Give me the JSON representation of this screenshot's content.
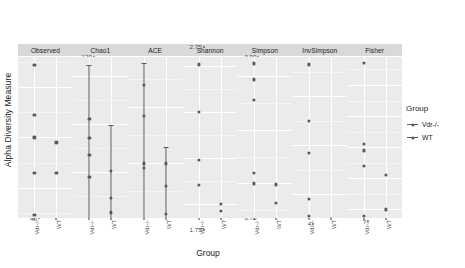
{
  "axes": {
    "y_title": "Alpha Diversity Measure",
    "x_title": "Group"
  },
  "legend": {
    "title": "Group",
    "items": [
      {
        "label": "Vdr-/-",
        "color": "#595959"
      },
      {
        "label": "WT",
        "color": "#595959"
      }
    ]
  },
  "groups": [
    "Vdr-/-",
    "WT"
  ],
  "chart_data": {
    "type": "scatter",
    "title": "",
    "xlabel": "Group",
    "ylabel": "Alpha Diversity Measure",
    "legend_position": "right",
    "grid": true,
    "facet_variable": "Alpha diversity index",
    "categories": [
      "Vdr-/-",
      "WT"
    ],
    "panels": [
      {
        "name": "Observed",
        "ylim": [
          37,
          76
        ],
        "ticks": [
          40,
          50,
          60,
          70
        ],
        "minor_ticks": [
          45,
          55,
          65,
          75
        ],
        "series": [
          {
            "name": "Vdr-/-",
            "values": [
              74.5,
              64.5,
              60.0,
              53.0,
              44.5
            ]
          },
          {
            "name": "WT",
            "values": [
              59.0,
              53.0,
              40.0
            ]
          }
        ],
        "errorbars": []
      },
      {
        "name": "Chao1",
        "ylim": [
          46,
          128
        ],
        "ticks": [
          60,
          80,
          100,
          120
        ],
        "minor_ticks": [
          50,
          70,
          90,
          110
        ],
        "series": [
          {
            "name": "Vdr-/-",
            "values": [
              102.0,
              94.0,
              87.0,
              78.0,
              57.5
            ]
          },
          {
            "name": "WT",
            "values": [
              80.5,
              69.0,
              63.0
            ]
          }
        ],
        "errorbars": [
          {
            "group": "Vdr-/-",
            "values": [
              102.0,
              94.0,
              87.0,
              78.0,
              57.5
            ],
            "lower": 48.0,
            "upper": 124.5
          },
          {
            "group": "WT",
            "values": [
              80.5,
              69.0,
              63.0
            ],
            "lower": 47.5,
            "upper": 99.5
          }
        ]
      },
      {
        "name": "ACE",
        "ylim": [
          48,
          118
        ],
        "ticks": [
          60,
          80,
          100
        ],
        "minor_ticks": [
          50,
          70,
          90,
          110
        ],
        "series": [
          {
            "name": "Vdr-/-",
            "values": [
              108.0,
              97.0,
              80.0,
              78.5,
              58.0
            ]
          },
          {
            "name": "WT",
            "values": [
              80.0,
              72.0,
              62.0
            ]
          }
        ],
        "errorbars": [
          {
            "group": "Vdr-/-",
            "values": [
              108.0,
              97.0,
              80.0,
              78.5,
              58.0
            ],
            "lower": 50.0,
            "upper": 116.0
          },
          {
            "group": "WT",
            "values": [
              80.0,
              72.0,
              62.0
            ],
            "lower": 53.0,
            "upper": 86.0
          }
        ]
      },
      {
        "name": "Shannon",
        "ylim": [
          1.73,
          2.8
        ],
        "ticks": [
          1.75,
          2.0,
          2.25,
          2.5,
          2.75
        ],
        "minor_ticks": [
          1.875,
          2.125,
          2.375,
          2.625
        ],
        "series": [
          {
            "name": "Vdr-/-",
            "values": [
              2.76,
              2.5,
              2.24,
              2.1
            ]
          },
          {
            "name": "WT",
            "values": [
              2.0,
              1.96,
              1.79
            ]
          }
        ],
        "errorbars": []
      },
      {
        "name": "Simpson",
        "ylim": [
          0.735,
          0.918
        ],
        "ticks": [
          0.75,
          0.8,
          0.85,
          0.9
        ],
        "minor_ticks": [
          0.775,
          0.825,
          0.875
        ],
        "series": [
          {
            "name": "Vdr-/-",
            "values": [
              0.912,
              0.897,
              0.878,
              0.81,
              0.8
            ]
          },
          {
            "name": "WT",
            "values": [
              0.799,
              0.782,
              0.748
            ]
          }
        ],
        "errorbars": []
      },
      {
        "name": "InvSimpson",
        "ylim": [
          3.6,
          11.6
        ],
        "ticks": [
          4,
          6,
          8,
          10
        ],
        "minor_ticks": [
          5,
          7,
          9,
          11
        ],
        "series": [
          {
            "name": "Vdr-/-",
            "values": [
              11.3,
              9.0,
              7.7,
              5.8,
              5.1
            ]
          },
          {
            "name": "WT",
            "values": [
              5.0,
              4.5,
              4.0
            ]
          }
        ],
        "errorbars": []
      },
      {
        "name": "Fisher",
        "ylim": [
          6.6,
          12.9
        ],
        "ticks": [
          7,
          8,
          9,
          10,
          11,
          12
        ],
        "minor_ticks": [
          7.5,
          8.5,
          9.5,
          10.5,
          11.5,
          12.5
        ],
        "series": [
          {
            "name": "Vdr-/-",
            "values": [
              12.7,
              10.1,
              9.9,
              9.4,
              7.8
            ]
          },
          {
            "name": "WT",
            "values": [
              9.1,
              8.0,
              6.9
            ]
          }
        ],
        "errorbars": []
      }
    ]
  }
}
